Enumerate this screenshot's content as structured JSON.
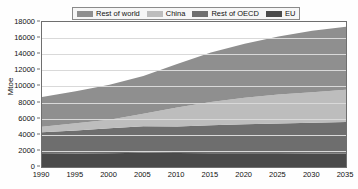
{
  "chart_data": {
    "type": "area",
    "stacked": true,
    "title": "",
    "subtitle": "",
    "xlabel": "",
    "ylabel": "Mtoe",
    "x": [
      1990,
      1995,
      2000,
      2005,
      2010,
      2015,
      2020,
      2025,
      2030,
      2035
    ],
    "xlim": [
      1990,
      2035
    ],
    "ylim": [
      0,
      18000
    ],
    "xticks": [
      "1990",
      "1995",
      "2000",
      "2005",
      "2010",
      "2015",
      "2020",
      "2025",
      "2030",
      "2035"
    ],
    "yticks": [
      "0",
      "2000",
      "4000",
      "6000",
      "8000",
      "10000",
      "12000",
      "14000",
      "16000",
      "18000"
    ],
    "grid": true,
    "legend_position": "top",
    "stack_order_bottom_to_top": [
      "EU",
      "Rest of OECD",
      "China",
      "Rest of world"
    ],
    "series": [
      {
        "name": "EU",
        "color": "#4a4a4a",
        "values": [
          1700,
          1680,
          1720,
          1760,
          1730,
          1720,
          1710,
          1700,
          1690,
          1680
        ]
      },
      {
        "name": "Rest of OECD",
        "color": "#6e6e6e",
        "values": [
          2600,
          2850,
          3100,
          3300,
          3300,
          3450,
          3600,
          3700,
          3800,
          3900
        ]
      },
      {
        "name": "China",
        "color": "#bdbdbd",
        "values": [
          700,
          900,
          1050,
          1550,
          2350,
          2900,
          3300,
          3600,
          3800,
          4000
        ]
      },
      {
        "name": "Rest of world",
        "color": "#8f8f8f",
        "values": [
          3700,
          3970,
          4330,
          4690,
          5420,
          6130,
          6690,
          7200,
          7610,
          7820
        ]
      }
    ],
    "cumulative_totals": [
      8700,
      9400,
      10200,
      11300,
      12800,
      14200,
      15300,
      16200,
      16900,
      17400
    ]
  },
  "legend": {
    "entries": [
      {
        "label": "Rest of world",
        "color": "#8f8f8f"
      },
      {
        "label": "China",
        "color": "#bdbdbd"
      },
      {
        "label": "Rest of OECD",
        "color": "#6e6e6e"
      },
      {
        "label": "EU",
        "color": "#4a4a4a"
      }
    ]
  },
  "axes": {
    "y_title": "Mtoe"
  }
}
